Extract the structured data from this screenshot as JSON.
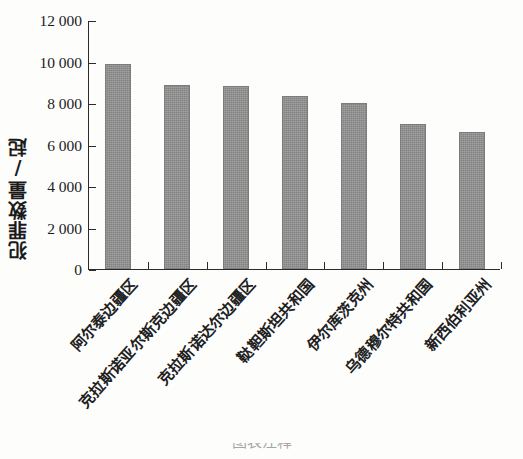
{
  "chart_data": {
    "type": "bar",
    "title": "",
    "subtitle": "",
    "xlabel": "",
    "ylabel": "犯罪数量/起",
    "ylim": [
      0,
      12000
    ],
    "ytick_labels": [
      "12 000",
      "10 000",
      "8 000",
      "6 000",
      "4 000",
      "2 000",
      "0"
    ],
    "ytick_values": [
      12000,
      10000,
      8000,
      6000,
      4000,
      2000,
      0
    ],
    "ytick_step": 2000,
    "grid": false,
    "legend": null,
    "legend_position": "none",
    "bar_color": "#8d8d8d",
    "axis_color": "#2b2b2b",
    "categories": [
      "阿尔泰边疆区",
      "克拉斯诺亚尔斯克边疆区",
      "克拉斯诺达尔边疆区",
      "鞑靼斯坦共和国",
      "伊尔库茨克州",
      "乌德穆尔特共和国",
      "新西伯利亚州"
    ],
    "values": [
      9900,
      8850,
      8800,
      8350,
      8000,
      7000,
      6600
    ],
    "annotations": []
  },
  "caption": {
    "cut_off_text": "图表注释"
  }
}
